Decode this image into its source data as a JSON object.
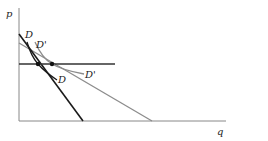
{
  "diagram": {
    "axes": {
      "y_label": "p",
      "x_label": "q"
    },
    "curves": [
      {
        "id": "D-line",
        "kind": "linear demand",
        "color": "#1a1a1a"
      },
      {
        "id": "Dprime-line",
        "kind": "linear demand",
        "color": "#8c8c8c"
      },
      {
        "id": "D-curve",
        "label": "D",
        "color": "#1a1a1a"
      },
      {
        "id": "Dprime-curve",
        "label": "D'",
        "color": "#8c8c8c"
      }
    ],
    "labels": {
      "d_top": "D",
      "dprime_top": "D'",
      "d_bottom": "D",
      "dprime_bottom": "D'"
    },
    "price_line": {
      "color": "#333333"
    },
    "points": [
      {
        "name": "intersection-D"
      },
      {
        "name": "intersection-Dprime"
      }
    ]
  }
}
